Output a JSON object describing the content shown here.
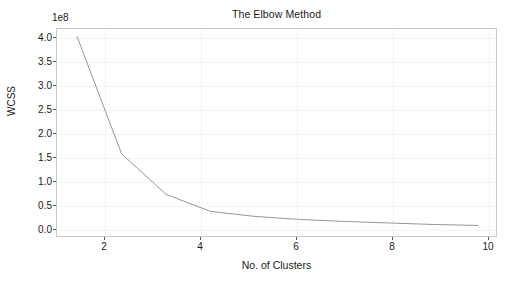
{
  "chart_data": {
    "type": "line",
    "title": "The Elbow Method",
    "xlabel": "No. of Clusters",
    "ylabel": "WCSS",
    "y_offset_label": "1e8",
    "y_scale_multiplier": 100000000,
    "x": [
      1,
      2,
      3,
      4,
      5,
      6,
      7,
      8,
      9,
      10
    ],
    "values": [
      3.97,
      1.63,
      0.82,
      0.48,
      0.38,
      0.32,
      0.28,
      0.25,
      0.22,
      0.2
    ],
    "series": [
      {
        "name": "WCSS",
        "values": [
          3.97,
          1.63,
          0.82,
          0.48,
          0.38,
          0.32,
          0.28,
          0.25,
          0.22,
          0.2
        ]
      }
    ],
    "xlim": [
      0.55,
      10.45
    ],
    "ylim": [
      -0.05,
      4.12
    ],
    "xticks": [
      2,
      4,
      6,
      8,
      10
    ],
    "xtick_labels": [
      "2",
      "4",
      "6",
      "8",
      "10"
    ],
    "yticks": [
      0.0,
      0.5,
      1.0,
      1.5,
      2.0,
      2.5,
      3.0,
      3.5,
      4.0
    ],
    "ytick_labels": [
      "0.0",
      "0.5",
      "1.0",
      "1.5",
      "2.0",
      "2.5",
      "3.0",
      "3.5",
      "4.0"
    ],
    "grid": true,
    "legend": null,
    "line_color": "#8a8a8a",
    "grid_color": "#f2f2f4",
    "axes_color": "#c8c8c8",
    "background_color": "#ffffff"
  }
}
